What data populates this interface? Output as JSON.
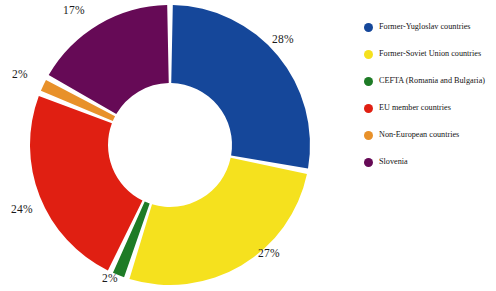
{
  "chart_data": {
    "type": "pie",
    "variant": "donut",
    "title": "",
    "subtitle": "",
    "xlabel": "",
    "ylabel": "",
    "grid": false,
    "legend_position": "right",
    "units": "percent",
    "total": 100,
    "start_angle_deg": 0,
    "direction": "clockwise",
    "categories": [
      "Former-Yugloslav countries",
      "Former-Soviet Union countries",
      "CEFTA (Romania and Bulgaria)",
      "EU member countries",
      "Non-European countries",
      "Slovenia"
    ],
    "values": [
      28,
      27,
      2,
      24,
      2,
      17
    ],
    "colors": [
      "#15479a",
      "#f5e11e",
      "#1e7b26",
      "#e01f12",
      "#e8912a",
      "#660a56"
    ],
    "slices": [
      {
        "label": "Former-Yugloslav countries",
        "value": 28,
        "display": "28%",
        "color": "#15479a"
      },
      {
        "label": "Former-Soviet Union countries",
        "value": 27,
        "display": "27%",
        "color": "#f5e11e"
      },
      {
        "label": "CEFTA (Romania and Bulgaria)",
        "value": 2,
        "display": "2%",
        "color": "#1e7b26"
      },
      {
        "label": "EU member countries",
        "value": 24,
        "display": "24%",
        "color": "#e01f12"
      },
      {
        "label": "Non-European countries",
        "value": 2,
        "display": "2%",
        "color": "#e8912a"
      },
      {
        "label": "Slovenia",
        "value": 17,
        "display": "17%",
        "color": "#660a56"
      }
    ]
  },
  "labels": {
    "blue": "28%",
    "yellow": "27%",
    "green": "2%",
    "red": "24%",
    "orange": "2%",
    "purple": "17%"
  },
  "legend": {
    "items": [
      {
        "label": "Former-Yugloslav countries",
        "color": "#15479a"
      },
      {
        "label": "Former-Soviet Union countries",
        "color": "#f5e11e"
      },
      {
        "label": "CEFTA (Romania and Bulgaria)",
        "color": "#1e7b26"
      },
      {
        "label": "EU member countries",
        "color": "#e01f12"
      },
      {
        "label": "Non-European countries",
        "color": "#e8912a"
      },
      {
        "label": "Slovenia",
        "color": "#660a56"
      }
    ]
  }
}
